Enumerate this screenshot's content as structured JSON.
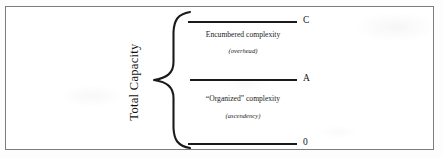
{
  "figure": {
    "axis_label": "Total Capacity",
    "brace_icon": "left-curly-brace-icon",
    "border_color": "#7d7d7d",
    "line_color": "#1a1a1a",
    "levels": [
      {
        "key": "top",
        "label": "C",
        "y": 21
      },
      {
        "key": "middle",
        "label": "A",
        "y": 79
      },
      {
        "key": "bottom",
        "label": "0",
        "y": 143
      }
    ],
    "bands": [
      {
        "key": "upper",
        "title": "Encumbered complexity",
        "subtitle": "(overhead)",
        "between": "C to A"
      },
      {
        "key": "lower",
        "title": "“Organized” complexity",
        "subtitle": "(ascendency)",
        "between": "A to 0"
      }
    ]
  }
}
